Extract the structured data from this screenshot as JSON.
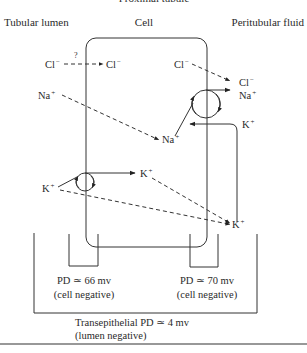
{
  "title": "Proximal tubule",
  "compartments": {
    "lumen": "Tubular lumen",
    "cell": "Cell",
    "peritubular": "Peritubular fluid"
  },
  "ions": {
    "cl_lumen": {
      "symbol": "Cl",
      "charge": "−"
    },
    "cl_cell": {
      "symbol": "Cl",
      "charge": "−"
    },
    "cl_cell_right": {
      "symbol": "Cl",
      "charge": "−"
    },
    "cl_peri": {
      "symbol": "Cl",
      "charge": "−"
    },
    "na_lumen": {
      "symbol": "Na",
      "charge": "+"
    },
    "na_cell": {
      "symbol": "Na",
      "charge": "+"
    },
    "na_peri": {
      "symbol": "Na",
      "charge": "+"
    },
    "k_peri_top": {
      "symbol": "K",
      "charge": "+"
    },
    "k_lumen": {
      "symbol": "K",
      "charge": "+"
    },
    "k_cell": {
      "symbol": "K",
      "charge": "+"
    },
    "k_peri_bottom": {
      "symbol": "K",
      "charge": "+"
    }
  },
  "question_mark": "?",
  "measurements": {
    "apical": {
      "line1": "PD ≃ 66 mv",
      "line2": "(cell negative)"
    },
    "basolateral": {
      "line1": "PD ≃ 70 mv",
      "line2": "(cell negative)"
    },
    "transepithelial": {
      "line1": "Transepithelial PD ≃ 4 mv",
      "line2": "(lumen negative)"
    }
  }
}
